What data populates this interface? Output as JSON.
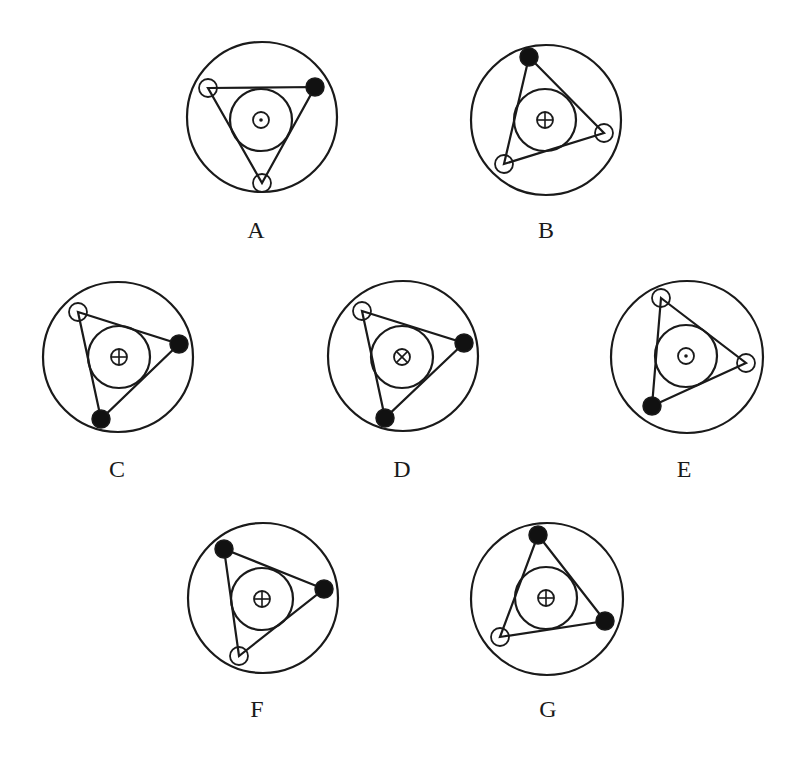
{
  "style": {
    "stroke": "#1a1a1a",
    "fill_dark": "#111111",
    "background": "#ffffff",
    "stroke_width": 2.2
  },
  "figures": [
    {
      "label": "A",
      "label_pos": [
        256,
        218
      ],
      "outer": {
        "cx": 262,
        "cy": 117,
        "r": 75
      },
      "inner": {
        "cx": 261,
        "cy": 120,
        "r": 31
      },
      "center_symbol": "dot",
      "center_symbol_r": 8,
      "vertices": [
        {
          "x": 208,
          "y": 88,
          "type": "open"
        },
        {
          "x": 315,
          "y": 87,
          "type": "filled"
        },
        {
          "x": 262,
          "y": 183,
          "type": "open"
        }
      ]
    },
    {
      "label": "B",
      "label_pos": [
        546,
        218
      ],
      "outer": {
        "cx": 546,
        "cy": 120,
        "r": 75
      },
      "inner": {
        "cx": 545,
        "cy": 120,
        "r": 31
      },
      "center_symbol": "plus",
      "center_symbol_r": 8,
      "vertices": [
        {
          "x": 529,
          "y": 57,
          "type": "filled"
        },
        {
          "x": 604,
          "y": 133,
          "type": "open"
        },
        {
          "x": 504,
          "y": 164,
          "type": "open"
        }
      ]
    },
    {
      "label": "C",
      "label_pos": [
        117,
        457
      ],
      "outer": {
        "cx": 118,
        "cy": 357,
        "r": 75
      },
      "inner": {
        "cx": 119,
        "cy": 357,
        "r": 31
      },
      "center_symbol": "plus",
      "center_symbol_r": 8,
      "vertices": [
        {
          "x": 78,
          "y": 312,
          "type": "open"
        },
        {
          "x": 179,
          "y": 344,
          "type": "filled"
        },
        {
          "x": 101,
          "y": 419,
          "type": "filled"
        }
      ]
    },
    {
      "label": "D",
      "label_pos": [
        402,
        457
      ],
      "outer": {
        "cx": 403,
        "cy": 356,
        "r": 75
      },
      "inner": {
        "cx": 402,
        "cy": 357,
        "r": 31
      },
      "center_symbol": "cross",
      "center_symbol_r": 8,
      "vertices": [
        {
          "x": 362,
          "y": 311,
          "type": "open"
        },
        {
          "x": 464,
          "y": 343,
          "type": "filled"
        },
        {
          "x": 385,
          "y": 418,
          "type": "filled"
        }
      ]
    },
    {
      "label": "E",
      "label_pos": [
        684,
        457
      ],
      "outer": {
        "cx": 687,
        "cy": 357,
        "r": 76
      },
      "inner": {
        "cx": 686,
        "cy": 356,
        "r": 31
      },
      "center_symbol": "dot",
      "center_symbol_r": 8,
      "vertices": [
        {
          "x": 661,
          "y": 298,
          "type": "open"
        },
        {
          "x": 746,
          "y": 363,
          "type": "open"
        },
        {
          "x": 652,
          "y": 406,
          "type": "filled"
        }
      ]
    },
    {
      "label": "F",
      "label_pos": [
        257,
        697
      ],
      "outer": {
        "cx": 263,
        "cy": 598,
        "r": 75
      },
      "inner": {
        "cx": 262,
        "cy": 599,
        "r": 31
      },
      "center_symbol": "plus",
      "center_symbol_r": 8,
      "vertices": [
        {
          "x": 224,
          "y": 549,
          "type": "filled"
        },
        {
          "x": 324,
          "y": 589,
          "type": "filled"
        },
        {
          "x": 239,
          "y": 656,
          "type": "open"
        }
      ]
    },
    {
      "label": "G",
      "label_pos": [
        548,
        697
      ],
      "outer": {
        "cx": 547,
        "cy": 599,
        "r": 76
      },
      "inner": {
        "cx": 546,
        "cy": 598,
        "r": 31
      },
      "center_symbol": "plus",
      "center_symbol_r": 8,
      "vertices": [
        {
          "x": 538,
          "y": 535,
          "type": "filled"
        },
        {
          "x": 605,
          "y": 621,
          "type": "filled"
        },
        {
          "x": 500,
          "y": 637,
          "type": "open"
        }
      ]
    }
  ],
  "vertex_radius": 9
}
